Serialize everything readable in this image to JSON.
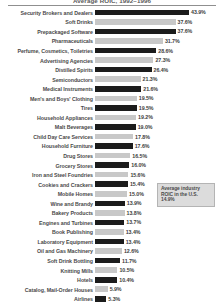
{
  "chart_data": {
    "type": "bar",
    "orientation": "horizontal",
    "title": "Average ROIC, 1992–1996",
    "xlabel": "",
    "ylabel": "",
    "grid": false,
    "legend": "none",
    "xlim": [
      0,
      43.9
    ],
    "value_suffix": "%",
    "categories": [
      "Security Brokers and Dealers",
      "Soft Drinks",
      "Prepackaged Software",
      "Pharmaceuticals",
      "Perfume, Cosmetics, Toiletries",
      "Advertising Agencies",
      "Distilled Spirits",
      "Semiconductors",
      "Medical Instruments",
      "Men's and Boys' Clothing",
      "Tires",
      "Household Appliances",
      "Malt Beverages",
      "Child Day Care Services",
      "Household Furniture",
      "Drug Stores",
      "Grocery Stores",
      "Iron and Steel Foundries",
      "Cookies and Crackers",
      "Mobile Homes",
      "Wine and Brandy",
      "Bakery Products",
      "Engines and Turbines",
      "Book Publishing",
      "Laboratory Equipment",
      "Oil and Gas Machinery",
      "Soft Drink Bottling",
      "Knitting Mills",
      "Hotels",
      "Catalog, Mail-Order Houses",
      "Airlines"
    ],
    "values": [
      43.9,
      37.6,
      37.6,
      31.7,
      28.6,
      27.3,
      26.4,
      21.3,
      21.6,
      19.5,
      19.5,
      19.2,
      19.0,
      17.8,
      17.6,
      16.5,
      16.0,
      15.6,
      15.4,
      15.0,
      13.9,
      13.8,
      13.7,
      13.4,
      13.4,
      12.6,
      11.7,
      10.5,
      10.4,
      5.9,
      5.3
    ],
    "value_labels": [
      "43.9%",
      "37.6%",
      "37.6%",
      "31.7%",
      "28.6%",
      "27.3%",
      "26.4%",
      "21.3%",
      "21.6%",
      "19.5%",
      "19.5%",
      "19.2%",
      "19.0%",
      "17.8%",
      "17.6%",
      "16.5%",
      "16.0%",
      "15.6%",
      "15.4%",
      "15.0%",
      "13.9%",
      "13.8%",
      "13.7%",
      "13.4%",
      "13.4%",
      "12.6%",
      "11.7%",
      "10.5%",
      "10.4%",
      "5.9%",
      "5.3%"
    ],
    "bar_styles": [
      "dark",
      "light",
      "dark",
      "light",
      "dark",
      "light",
      "dark",
      "light",
      "dark",
      "light",
      "dark",
      "light",
      "dark",
      "light",
      "dark",
      "light",
      "dark",
      "light",
      "dark",
      "light",
      "dark",
      "light",
      "dark",
      "light",
      "dark",
      "light",
      "dark",
      "light",
      "dark",
      "light",
      "dark"
    ],
    "colors": {
      "bar_dark": "#1c1c1c",
      "bar_light": "#c8c8c8",
      "label_text": "#4a4a4a",
      "annotation_background": "#dcdcdc",
      "annotation_border": "#b4b4b4"
    }
  },
  "annotation": {
    "text": "Average industry ROIC in the U.S.",
    "value": "14.9%"
  }
}
